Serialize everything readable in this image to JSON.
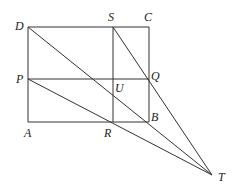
{
  "diagram": {
    "type": "geometry",
    "points": {
      "D": {
        "label": "D",
        "x": 28,
        "y": 27
      },
      "S": {
        "label": "S",
        "x": 113,
        "y": 27
      },
      "C": {
        "label": "C",
        "x": 149,
        "y": 27
      },
      "P": {
        "label": "P",
        "x": 28,
        "y": 79
      },
      "U": {
        "label": "U",
        "x": 113,
        "y": 79
      },
      "Q": {
        "label": "Q",
        "x": 149,
        "y": 79
      },
      "A": {
        "label": "A",
        "x": 28,
        "y": 122
      },
      "R": {
        "label": "R",
        "x": 113,
        "y": 122
      },
      "B": {
        "label": "B",
        "x": 149,
        "y": 122
      },
      "T": {
        "label": "T",
        "x": 212,
        "y": 175
      }
    },
    "segments": [
      [
        "D",
        "C"
      ],
      [
        "C",
        "B"
      ],
      [
        "B",
        "A"
      ],
      [
        "A",
        "D"
      ],
      [
        "S",
        "R"
      ],
      [
        "P",
        "Q"
      ],
      [
        "D",
        "T"
      ],
      [
        "S",
        "T"
      ],
      [
        "P",
        "T"
      ]
    ]
  }
}
